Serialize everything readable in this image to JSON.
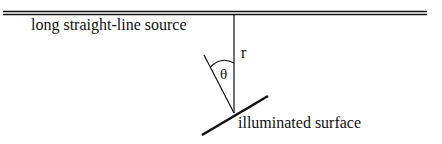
{
  "diagram": {
    "labels": {
      "source": "long straight-line source",
      "distance": "r",
      "angle": "θ",
      "surface": "illuminated surface"
    },
    "colors": {
      "line": "#111111",
      "background": "#ffffff"
    },
    "elements": [
      {
        "type": "double-line",
        "name": "line-source",
        "from": [
          3,
          13
        ],
        "to": [
          427,
          13
        ]
      },
      {
        "type": "line",
        "name": "distance-r",
        "from": [
          234,
          13
        ],
        "to": [
          234,
          113
        ]
      },
      {
        "type": "line",
        "name": "surface-normal",
        "from": [
          204,
          55
        ],
        "to": [
          234,
          113
        ]
      },
      {
        "type": "line",
        "name": "illuminated-surface",
        "from": [
          202,
          135
        ],
        "to": [
          268,
          96
        ]
      },
      {
        "type": "arc",
        "name": "angle-theta-arc",
        "center": [
          234,
          113
        ]
      }
    ]
  }
}
